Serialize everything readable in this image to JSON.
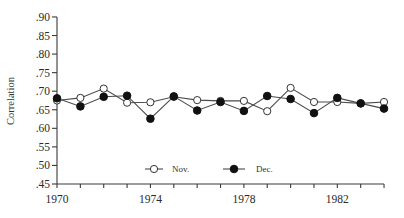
{
  "chart_data": {
    "type": "line",
    "title": "",
    "xlabel": "",
    "ylabel": "Correlation",
    "x": [
      1970,
      1971,
      1972,
      1973,
      1974,
      1975,
      1976,
      1977,
      1978,
      1979,
      1980,
      1981,
      1982,
      1983,
      1984
    ],
    "series": [
      {
        "name": "Nov.",
        "marker": "open-circle",
        "values": [
          0.675,
          0.682,
          0.707,
          0.669,
          0.67,
          0.685,
          0.676,
          0.674,
          0.674,
          0.646,
          0.709,
          0.671,
          0.671,
          0.667,
          0.671
        ]
      },
      {
        "name": "Dec.",
        "marker": "filled-circle",
        "values": [
          0.681,
          0.659,
          0.685,
          0.688,
          0.626,
          0.686,
          0.648,
          0.671,
          0.647,
          0.687,
          0.679,
          0.641,
          0.682,
          0.667,
          0.653
        ]
      }
    ],
    "xlim": [
      1970,
      1984
    ],
    "ylim": [
      0.45,
      0.9
    ],
    "x_tick_labels": [
      "1970",
      "1974",
      "1978",
      "1982"
    ],
    "x_tick_label_years": [
      1970,
      1974,
      1978,
      1982
    ],
    "x_minor_ticks": "every year",
    "y_ticks": [
      0.45,
      0.5,
      0.55,
      0.6,
      0.65,
      0.7,
      0.75,
      0.8,
      0.85,
      0.9
    ],
    "y_tick_labels": [
      ".45",
      ".50",
      ".55",
      ".60",
      ".65",
      ".70",
      ".75",
      ".80",
      ".85",
      ".90"
    ],
    "grid": false,
    "legend_position": "inside bottom center",
    "legend": [
      "Nov.",
      "Dec."
    ]
  },
  "colors": {
    "axis": "#3a3a3a",
    "line": "#4a4a4a",
    "marker_fill_open": "#ffffff",
    "marker_fill_filled": "#111111"
  }
}
